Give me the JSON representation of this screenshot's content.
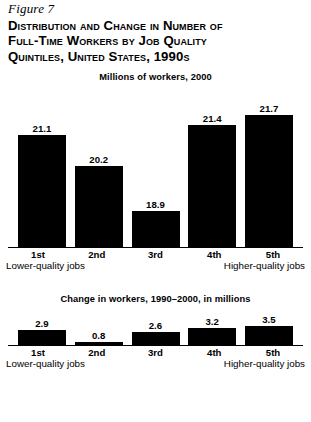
{
  "figure": {
    "label": "Figure 7",
    "title_lines": [
      "Distribution and Change in Number of",
      "Full-Time Workers by Job Quality",
      "Quintiles, United States, 1990s"
    ]
  },
  "axis_ends": {
    "left": "Lower-quality jobs",
    "right": "Higher-quality jobs"
  },
  "footnote": "",
  "chart_data": [
    {
      "type": "bar",
      "title": "Millions of workers, 2000",
      "categories": [
        "1st",
        "2nd",
        "3rd",
        "4th",
        "5th"
      ],
      "values": [
        21.1,
        20.2,
        18.9,
        21.4,
        21.7
      ],
      "value_labels": [
        "21.1",
        "20.2",
        "18.9",
        "21.4",
        "21.7"
      ],
      "xlabel": "",
      "ylabel": "Millions of workers",
      "ylim": [
        17.8,
        22.1
      ],
      "grid": false,
      "legend": "none",
      "bar_color": "#000000",
      "axis_end_left": "Lower-quality jobs",
      "axis_end_right": "Higher-quality jobs"
    },
    {
      "type": "bar",
      "title": "Change in workers, 1990–2000, in millions",
      "categories": [
        "1st",
        "2nd",
        "3rd",
        "4th",
        "5th"
      ],
      "values": [
        2.9,
        0.8,
        2.6,
        3.2,
        3.5
      ],
      "value_labels": [
        "2.9",
        "0.8",
        "2.6",
        "3.2",
        "3.5"
      ],
      "xlabel": "",
      "ylabel": "Change in workers, millions",
      "ylim": [
        0,
        3.9
      ],
      "grid": false,
      "legend": "none",
      "bar_color": "#000000",
      "axis_end_left": "Lower-quality jobs",
      "axis_end_right": "Higher-quality jobs"
    }
  ]
}
